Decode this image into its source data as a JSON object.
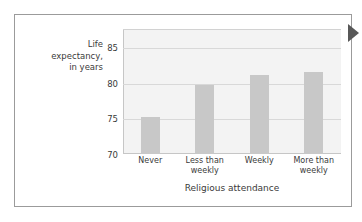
{
  "figure": {
    "marker_icon": "triangle-right-icon",
    "marker_color": "#585858",
    "border_color": "#9b9b9b",
    "background": "#ffffff"
  },
  "chart_data": {
    "type": "bar",
    "title": "",
    "categories": [
      "Never",
      "Less than\nweekly",
      "Weekly",
      "More than\nweekly"
    ],
    "values": [
      75.2,
      79.7,
      81.0,
      81.5
    ],
    "xlabel": "Religious attendance",
    "ylabel": "Life\nexpectancy,\nin years",
    "ylim": [
      70,
      87.5
    ],
    "yticks": [
      70,
      75,
      80,
      85
    ],
    "ytick_labels": [
      "70",
      "75",
      "80",
      "85"
    ],
    "grid": true,
    "legend": false,
    "bar_color": "#c8c8c8",
    "plot_background": "#f3f3f3",
    "gridline_color": "#d8d8d8"
  }
}
